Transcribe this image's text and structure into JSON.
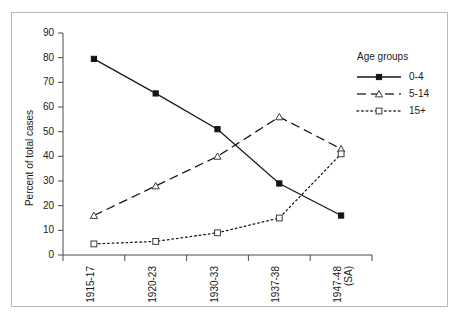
{
  "chart_data": {
    "type": "line",
    "title": "",
    "xlabel": "",
    "ylabel": "Percent of total cases",
    "ylim": [
      0,
      90
    ],
    "yticks": [
      0,
      10,
      20,
      30,
      40,
      50,
      60,
      70,
      80,
      90
    ],
    "grid": false,
    "legend_position": "top-right",
    "legend_title": "Age groups",
    "categories": [
      "1915-17",
      "1920-23",
      "1930-33",
      "1937-38",
      "1947-48"
    ],
    "category_sublabels": [
      "",
      "",
      "",
      "",
      "(SA)"
    ],
    "series": [
      {
        "name": "0-4",
        "values": [
          79.5,
          65.5,
          51,
          29,
          16
        ],
        "linestyle": "solid",
        "marker": "filled-square",
        "color": "#141414"
      },
      {
        "name": "5-14",
        "values": [
          16,
          28,
          40,
          56,
          43
        ],
        "linestyle": "dashed",
        "marker": "open-triangle",
        "color": "#3a3a3a"
      },
      {
        "name": "15+",
        "values": [
          4.5,
          5.5,
          9,
          15,
          41
        ],
        "linestyle": "dotted",
        "marker": "open-square",
        "color": "#3a3a3a"
      }
    ]
  },
  "figure": {
    "border_color": "#b9b9b9",
    "background": "#ffffff",
    "axis_color": "#4a4a4a"
  }
}
